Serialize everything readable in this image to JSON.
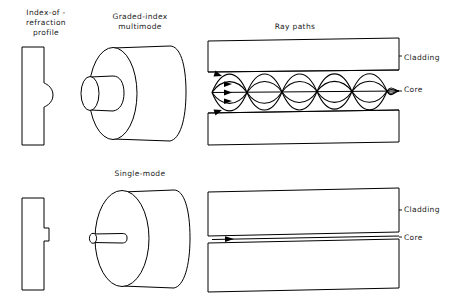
{
  "figure": {
    "background_color": "#ffffff",
    "line_color": "#000000",
    "text_color": "#1a1a1a"
  },
  "columns": {
    "profile_heading_line1": "Index-of -",
    "profile_heading_line2": "refraction",
    "profile_heading_line3": "profile",
    "raypaths_heading": "Ray paths"
  },
  "rows": [
    {
      "id": "graded-index-multimode",
      "fiber_heading_line1": "Graded-index",
      "fiber_heading_line2": "multimode",
      "profile_shape": "rounded-bulge",
      "core_label": "Core",
      "cladding_label": "Cladding",
      "ray_count": 5,
      "ray_periods": 4,
      "ray_style": "sinusoidal"
    },
    {
      "id": "single-mode",
      "fiber_heading_line1": "Single-mode",
      "fiber_heading_line2": "",
      "profile_shape": "narrow-step",
      "core_label": "Core",
      "cladding_label": "Cladding",
      "ray_count": 1,
      "ray_periods": 0,
      "ray_style": "straight"
    }
  ]
}
